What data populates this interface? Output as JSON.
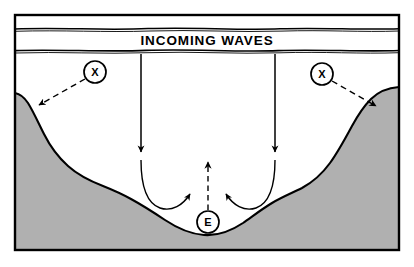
{
  "figure": {
    "background_color": "#ffffff",
    "frame_color": "#000000",
    "seabed_fill_color": "#b0b0b0",
    "seabed_outline_color": "#000000",
    "line_color": "#000000"
  },
  "wave_band": {
    "label": "INCOMING WAVES",
    "top_line_label": "wave-crest-line-top",
    "bottom_line_label": "wave-crest-line-bottom"
  },
  "nodes": [
    {
      "id": "x-left",
      "label": "X",
      "cx": 95,
      "cy": 72,
      "r": 11
    },
    {
      "id": "x-right",
      "label": "X",
      "cx": 322,
      "cy": 74,
      "r": 11
    },
    {
      "id": "e-center",
      "label": "E",
      "cx": 208,
      "cy": 222,
      "r": 11
    }
  ],
  "arrows": {
    "dashed_left": {
      "name": "longshore-arrow-left",
      "from": "x-left",
      "to": "left-shore",
      "style": "dashed",
      "direction": "down-left"
    },
    "dashed_right": {
      "name": "longshore-arrow-right",
      "from": "x-right",
      "to": "right-shore",
      "style": "dashed",
      "direction": "down-right"
    },
    "dashed_up": {
      "name": "rip-current-arrow",
      "from": "e-center",
      "to": "offshore-surface",
      "style": "dashed",
      "direction": "up"
    },
    "down_left": {
      "name": "wave-incoming-arrow-left",
      "style": "solid",
      "direction": "down"
    },
    "down_right": {
      "name": "wave-incoming-arrow-right",
      "style": "solid",
      "direction": "down"
    },
    "curve_left": {
      "name": "circulation-curve-left",
      "style": "solid",
      "direction": "clockwise-inward"
    },
    "curve_right": {
      "name": "circulation-curve-right",
      "style": "solid",
      "direction": "counterclockwise-inward"
    }
  },
  "seabed": {
    "name": "seabed-profile",
    "description": "Submerged bay floor sloping down from both sides to a central basin"
  }
}
